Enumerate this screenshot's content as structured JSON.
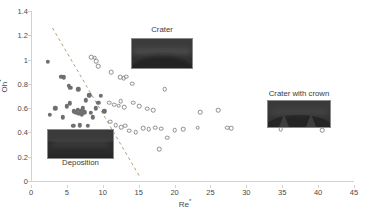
{
  "chart_data": {
    "type": "scatter",
    "title": "",
    "xlabel": "Re*",
    "ylabel": "Oh*",
    "xlim": [
      0,
      45
    ],
    "ylim": [
      0,
      1.4
    ],
    "xticks": [
      0,
      5,
      10,
      15,
      20,
      25,
      30,
      35,
      40,
      45
    ],
    "yticks": [
      "0",
      "0.2",
      "0.4",
      "0.6",
      "0.8",
      "1",
      "1.2",
      "1.4"
    ],
    "grid": false,
    "legend_position": "none",
    "annotations": [
      {
        "label": "Crater",
        "kind": "inset-photo"
      },
      {
        "label": "Deposition",
        "kind": "inset-photo"
      },
      {
        "label": "Crater with crown",
        "kind": "inset-photo"
      }
    ],
    "separatrix": {
      "style": "dashed",
      "color": "#b4a07a",
      "x": [
        3.0,
        15.2
      ],
      "y": [
        1.26,
        0.03
      ]
    },
    "series": [
      {
        "name": "Deposition",
        "marker": "filled-circle",
        "color": "#6f6f6f",
        "points": [
          [
            2.3,
            0.98
          ],
          [
            4.2,
            0.86
          ],
          [
            4.6,
            0.855
          ],
          [
            5.3,
            0.785
          ],
          [
            5.5,
            0.77
          ],
          [
            6.6,
            0.755
          ],
          [
            3.4,
            0.6
          ],
          [
            5.0,
            0.615
          ],
          [
            5.4,
            0.64
          ],
          [
            6.0,
            0.575
          ],
          [
            6.3,
            0.565
          ],
          [
            6.5,
            0.585
          ],
          [
            6.7,
            0.555
          ],
          [
            6.9,
            0.575
          ],
          [
            7.1,
            0.545
          ],
          [
            7.2,
            0.6
          ],
          [
            7.4,
            0.565
          ],
          [
            2.6,
            0.545
          ],
          [
            4.4,
            0.525
          ],
          [
            8.3,
            0.56
          ],
          [
            9.0,
            0.6
          ],
          [
            5.9,
            0.455
          ],
          [
            6.8,
            0.46
          ],
          [
            7.9,
            0.455
          ],
          [
            8.6,
            0.525
          ],
          [
            9.4,
            0.645
          ],
          [
            9.7,
            0.7
          ],
          [
            10.2,
            0.575
          ],
          [
            7.6,
            0.665
          ],
          [
            8.1,
            0.705
          ]
        ]
      },
      {
        "name": "Crater",
        "marker": "open-circle",
        "color": "#8c8c8c",
        "points": [
          [
            8.4,
            1.02
          ],
          [
            8.9,
            1.015
          ],
          [
            9.1,
            0.985
          ],
          [
            9.4,
            0.945
          ],
          [
            11.2,
            0.895
          ],
          [
            12.4,
            0.855
          ],
          [
            12.9,
            0.845
          ],
          [
            13.3,
            0.86
          ],
          [
            14.1,
            0.8
          ],
          [
            10.9,
            0.645
          ],
          [
            11.6,
            0.63
          ],
          [
            12.2,
            0.62
          ],
          [
            12.5,
            0.655
          ],
          [
            13.0,
            0.61
          ],
          [
            14.2,
            0.645
          ],
          [
            15.1,
            0.615
          ],
          [
            16.2,
            0.595
          ],
          [
            17.0,
            0.585
          ],
          [
            11.0,
            0.49
          ],
          [
            11.8,
            0.46
          ],
          [
            12.6,
            0.445
          ],
          [
            13.1,
            0.455
          ],
          [
            13.7,
            0.415
          ],
          [
            14.6,
            0.4
          ],
          [
            15.6,
            0.435
          ],
          [
            16.4,
            0.425
          ],
          [
            17.3,
            0.44
          ],
          [
            18.1,
            0.43
          ],
          [
            19.0,
            0.355
          ],
          [
            18.6,
            0.755
          ],
          [
            20.0,
            0.42
          ],
          [
            21.2,
            0.425
          ],
          [
            17.9,
            0.26
          ],
          [
            23.6,
            0.565
          ],
          [
            23.2,
            0.44
          ],
          [
            26.1,
            0.585
          ],
          [
            27.3,
            0.44
          ],
          [
            27.9,
            0.435
          ]
        ]
      },
      {
        "name": "Crater with crown",
        "marker": "open-circle",
        "color": "#8c8c8c",
        "points": [
          [
            34.8,
            0.425
          ],
          [
            40.6,
            0.42
          ]
        ]
      }
    ]
  },
  "insets": {
    "crater": {
      "caption": "Crater"
    },
    "deposition": {
      "caption": "Deposition"
    },
    "crater_with_crown": {
      "caption": "Crater with crown"
    }
  }
}
